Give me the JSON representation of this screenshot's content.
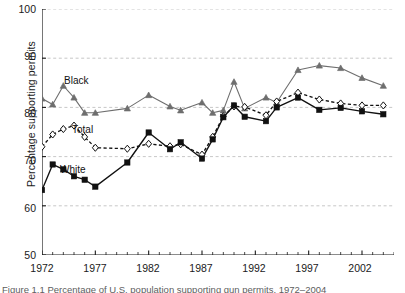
{
  "figure": {
    "ylabel": "Percentage supporting permits",
    "caption": "Figure 1.1 Percentage of U.S. population supporting gun permits, 1972–2004"
  },
  "axes": {
    "y_ticks": [
      100,
      90,
      80,
      70,
      60,
      50
    ],
    "y_min": 50,
    "y_max": 100,
    "x_ticks_labeled": [
      1972,
      1977,
      1982,
      1987,
      1992,
      1997,
      2002
    ],
    "x_min": 1972,
    "x_max": 2005,
    "grid": "horizontal-dashed"
  },
  "series_labels": {
    "black": "Black",
    "total": "Total",
    "white": "White"
  },
  "colors": {
    "black_series": "#6e6e6e",
    "total_series": "#111111",
    "white_series": "#111111",
    "grid": "#b9b9b9",
    "axis": "#1a1a1a",
    "text": "#1a1a1a",
    "caption_text": "#5d5d5d"
  },
  "chart_data": {
    "type": "line",
    "title": "",
    "xlabel": "",
    "ylabel": "Percentage supporting permits",
    "xlim": [
      1972,
      2005
    ],
    "ylim": [
      50,
      100
    ],
    "grid": true,
    "legend": "inline-labels",
    "annotations": [
      "Black",
      "Total",
      "White"
    ],
    "series": [
      {
        "name": "Black",
        "marker": "triangle",
        "linestyle": "solid",
        "color": "#6e6e6e",
        "x": [
          1972,
          1973,
          1974,
          1975,
          1976,
          1977,
          1980,
          1982,
          1984,
          1985,
          1987,
          1988,
          1989,
          1990,
          1991,
          1993,
          1994,
          1996,
          1998,
          2000,
          2002,
          2004
        ],
        "values": [
          81.8,
          80.6,
          84.4,
          82.0,
          78.9,
          78.9,
          79.8,
          82.5,
          80.2,
          79.4,
          81.0,
          78.9,
          79.4,
          85.2,
          79.8,
          82.0,
          81.0,
          87.6,
          88.5,
          88.0,
          86.0,
          84.4
        ]
      },
      {
        "name": "Total",
        "marker": "diamond-open",
        "linestyle": "dashed",
        "color": "#111111",
        "x": [
          1972,
          1973,
          1974,
          1975,
          1976,
          1977,
          1980,
          1982,
          1984,
          1985,
          1987,
          1988,
          1989,
          1990,
          1991,
          1993,
          1994,
          1996,
          1998,
          2000,
          2002,
          2004
        ],
        "values": [
          72.0,
          74.5,
          75.6,
          76.3,
          74.0,
          71.8,
          71.6,
          72.6,
          72.1,
          72.5,
          70.4,
          74.0,
          78.2,
          80.2,
          80.1,
          78.4,
          81.2,
          83.0,
          81.6,
          80.8,
          80.4,
          80.4
        ]
      },
      {
        "name": "White",
        "marker": "square-filled",
        "linestyle": "solid",
        "color": "#111111",
        "x": [
          1972,
          1973,
          1974,
          1975,
          1976,
          1977,
          1980,
          1982,
          1984,
          1985,
          1987,
          1988,
          1989,
          1990,
          1991,
          1993,
          1994,
          1996,
          1998,
          2000,
          2002,
          2004
        ],
        "values": [
          63.2,
          68.4,
          67.4,
          66.0,
          65.3,
          63.9,
          68.8,
          74.9,
          71.5,
          72.9,
          69.6,
          73.5,
          78.0,
          80.4,
          78.1,
          77.2,
          80.0,
          82.0,
          79.5,
          79.9,
          79.2,
          78.6
        ]
      }
    ]
  }
}
